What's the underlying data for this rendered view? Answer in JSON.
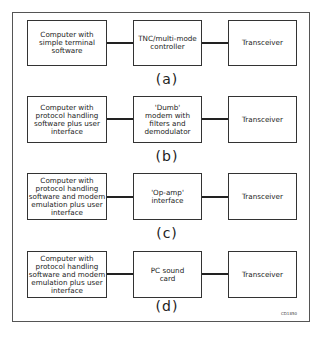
{
  "figure_code": "CD1850",
  "rows": [
    {
      "caption": "(a)",
      "left": "Computer with simple terminal software",
      "middle": "TNC/multi-mode controller",
      "right": "Transceiver"
    },
    {
      "caption": "(b)",
      "left": "Computer with protocol handling software plus user interface",
      "middle": "'Dumb' modem with filters and demodulator",
      "right": "Transceiver"
    },
    {
      "caption": "(c)",
      "left": "Computer with protocol handling software and modem emulation plus user interface",
      "middle": "'Op-amp' interface",
      "right": "Transceiver"
    },
    {
      "caption": "(d)",
      "left": "Computer with protocol handling software and modem emulation plus user interface",
      "middle": "PC sound card",
      "right": "Transceiver"
    }
  ]
}
